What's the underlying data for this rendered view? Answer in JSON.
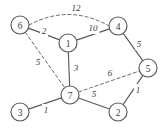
{
  "figure": {
    "width": 167,
    "height": 128,
    "background": "#ffffff",
    "stroke_color": "#5a5a5a",
    "text_color": "#3c3c3c"
  },
  "chart_data": {
    "type": "diagram",
    "diagram_kind": "weighted-undirected-graph",
    "title": "",
    "xlabel": "",
    "ylabel": "",
    "grid": false,
    "legend": "none",
    "nodes": [
      {
        "id": "6",
        "label": "6",
        "x": 20,
        "y": 25,
        "r": 9
      },
      {
        "id": "1",
        "label": "1",
        "x": 68,
        "y": 43,
        "r": 9
      },
      {
        "id": "4",
        "label": "4",
        "x": 118,
        "y": 26,
        "r": 9
      },
      {
        "id": "5",
        "label": "5",
        "x": 148,
        "y": 68,
        "r": 9
      },
      {
        "id": "7",
        "label": "7",
        "x": 70,
        "y": 95,
        "r": 9
      },
      {
        "id": "2",
        "label": "2",
        "x": 118,
        "y": 112,
        "r": 9
      },
      {
        "id": "3",
        "label": "3",
        "x": 20,
        "y": 112,
        "r": 9
      }
    ],
    "edges": [
      {
        "id": "e-6-4",
        "from": "6",
        "to": "4",
        "weight": "12",
        "style": "dashed",
        "curved": true,
        "label_x": 76,
        "label_y": 8
      },
      {
        "id": "e-6-1",
        "from": "6",
        "to": "1",
        "weight": "2",
        "style": "solid",
        "curved": false,
        "label_x": 44,
        "label_y": 31
      },
      {
        "id": "e-1-4",
        "from": "1",
        "to": "4",
        "weight": "10",
        "style": "solid",
        "curved": false,
        "label_x": 93,
        "label_y": 28
      },
      {
        "id": "e-4-5",
        "from": "4",
        "to": "5",
        "weight": "5",
        "style": "solid",
        "curved": false,
        "label_x": 139,
        "label_y": 44
      },
      {
        "id": "e-6-7",
        "from": "6",
        "to": "7",
        "weight": "5",
        "style": "dashed",
        "curved": false,
        "label_x": 38,
        "label_y": 62
      },
      {
        "id": "e-1-7",
        "from": "1",
        "to": "7",
        "weight": "3",
        "style": "solid",
        "curved": false,
        "label_x": 76,
        "label_y": 68
      },
      {
        "id": "e-7-5",
        "from": "7",
        "to": "5",
        "weight": "6",
        "style": "dashed",
        "curved": false,
        "label_x": 110,
        "label_y": 73
      },
      {
        "id": "e-3-7",
        "from": "3",
        "to": "7",
        "weight": "1",
        "style": "solid",
        "curved": false,
        "label_x": 46,
        "label_y": 110
      },
      {
        "id": "e-7-2",
        "from": "7",
        "to": "2",
        "weight": "5",
        "style": "solid",
        "curved": false,
        "label_x": 94,
        "label_y": 94
      },
      {
        "id": "e-2-5",
        "from": "2",
        "to": "5",
        "weight": "1",
        "style": "solid",
        "curved": false,
        "label_x": 138,
        "label_y": 90
      }
    ]
  }
}
